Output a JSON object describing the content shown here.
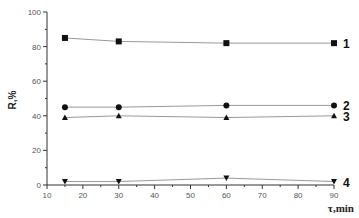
{
  "chart_data": {
    "type": "line",
    "title": "",
    "xlabel": "τ,min",
    "ylabel": "R,%",
    "xlim": [
      10,
      90
    ],
    "ylim": [
      0,
      100
    ],
    "xticks": [
      10,
      20,
      30,
      40,
      50,
      60,
      70,
      80,
      90
    ],
    "yticks": [
      0,
      20,
      40,
      60,
      80,
      100
    ],
    "grid": false,
    "legend_position": "inline-right",
    "x": [
      15,
      30,
      60,
      90
    ],
    "series": [
      {
        "name": "1",
        "marker": "square",
        "values": [
          85,
          83,
          82,
          82
        ]
      },
      {
        "name": "2",
        "marker": "circle",
        "values": [
          45,
          45,
          46,
          46
        ]
      },
      {
        "name": "3",
        "marker": "triangle-up",
        "values": [
          39,
          40,
          39,
          40
        ]
      },
      {
        "name": "4",
        "marker": "triangle-down",
        "values": [
          2,
          2,
          4,
          2
        ]
      }
    ]
  },
  "colors": {
    "axis": "#333333",
    "line": "#999999",
    "marker": "#111111"
  }
}
